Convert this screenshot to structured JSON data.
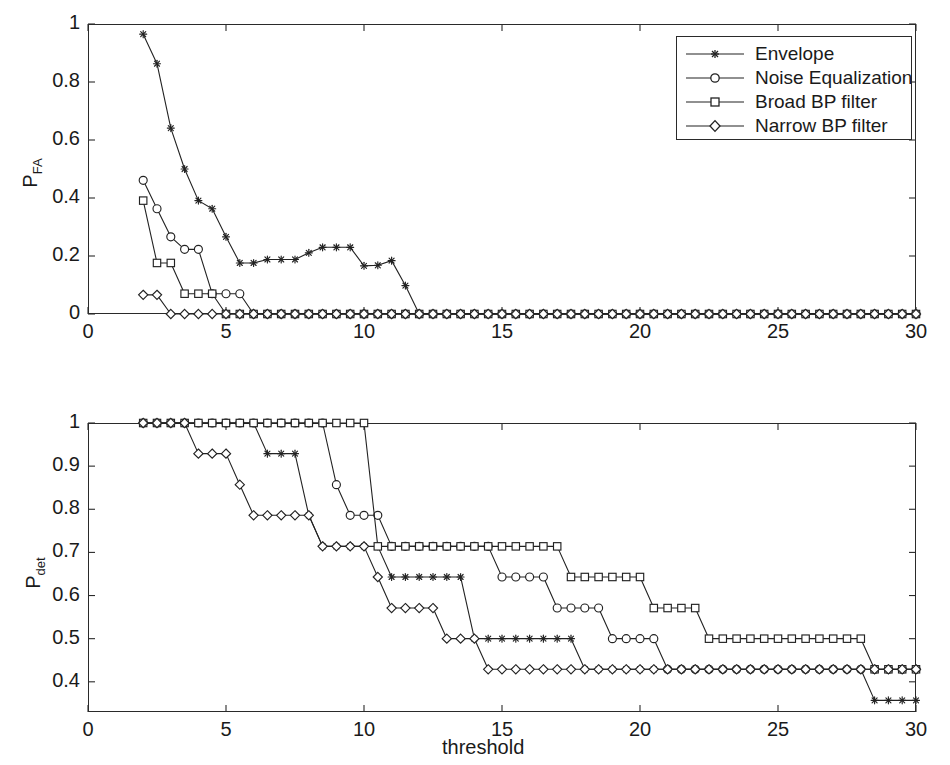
{
  "figure": {
    "background": "#ffffff",
    "line_color": "#222222",
    "axis_color": "#2a2a2a"
  },
  "legend": {
    "position": "top-right-of-upper-panel",
    "entries": [
      {
        "label": "Envelope",
        "marker": "star"
      },
      {
        "label": "Noise Equalization",
        "marker": "circle"
      },
      {
        "label": "Broad BP filter",
        "marker": "square"
      },
      {
        "label": "Narrow BP filter",
        "marker": "diamond"
      }
    ]
  },
  "chart_data": [
    {
      "type": "line",
      "panel": "upper",
      "title": "",
      "xlabel": "",
      "ylabel": "P_FA",
      "ylabel_base": "P",
      "ylabel_sub": "FA",
      "xlim": [
        0,
        30
      ],
      "ylim": [
        0,
        1
      ],
      "xticks": [
        0,
        5,
        10,
        15,
        20,
        25,
        30
      ],
      "xticklabels": [
        "0",
        "5",
        "10",
        "15",
        "20",
        "25",
        "30"
      ],
      "yticks": [
        0,
        0.2,
        0.4,
        0.6,
        0.8,
        1
      ],
      "yticklabels": [
        "0",
        "0.2",
        "0.4",
        "0.6",
        "0.8",
        "1"
      ],
      "grid": false,
      "legend_position": "upper right",
      "x": [
        2,
        2.5,
        3,
        3.5,
        4,
        4.5,
        5,
        5.5,
        6,
        6.5,
        7,
        7.5,
        8,
        8.5,
        9,
        9.5,
        10,
        10.5,
        11,
        11.5,
        12,
        12.5,
        13,
        13.5,
        14,
        14.5,
        15,
        15.5,
        16,
        16.5,
        17,
        17.5,
        18,
        18.5,
        19,
        19.5,
        20,
        20.5,
        21,
        21.5,
        22,
        22.5,
        23,
        23.5,
        24,
        24.5,
        25,
        25.5,
        26,
        26.5,
        27,
        27.5,
        28,
        28.5,
        29,
        29.5,
        30
      ],
      "series": [
        {
          "name": "Envelope",
          "marker": "star",
          "values": [
            0.965,
            0.863,
            0.641,
            0.5,
            0.391,
            0.363,
            0.266,
            0.176,
            0.176,
            0.188,
            0.188,
            0.188,
            0.211,
            0.23,
            0.23,
            0.23,
            0.166,
            0.168,
            0.184,
            0.098,
            0,
            0,
            0,
            0,
            0,
            0,
            0,
            0,
            0,
            0,
            0,
            0,
            0,
            0,
            0,
            0,
            0,
            0,
            0,
            0,
            0,
            0,
            0,
            0,
            0,
            0,
            0,
            0,
            0,
            0,
            0,
            0,
            0,
            0,
            0,
            0,
            0
          ]
        },
        {
          "name": "Noise Equalization",
          "marker": "circle",
          "values": [
            0.461,
            0.363,
            0.266,
            0.223,
            0.223,
            0.07,
            0.07,
            0.07,
            0,
            0,
            0,
            0,
            0,
            0,
            0,
            0,
            0,
            0,
            0,
            0,
            0,
            0,
            0,
            0,
            0,
            0,
            0,
            0,
            0,
            0,
            0,
            0,
            0,
            0,
            0,
            0,
            0,
            0,
            0,
            0,
            0,
            0,
            0,
            0,
            0,
            0,
            0,
            0,
            0,
            0,
            0,
            0,
            0,
            0,
            0,
            0,
            0
          ]
        },
        {
          "name": "Broad BP filter",
          "marker": "square",
          "values": [
            0.391,
            0.176,
            0.176,
            0.07,
            0.07,
            0.07,
            0,
            0,
            0,
            0,
            0,
            0,
            0,
            0,
            0,
            0,
            0,
            0,
            0,
            0,
            0,
            0,
            0,
            0,
            0,
            0,
            0,
            0,
            0,
            0,
            0,
            0,
            0,
            0,
            0,
            0,
            0,
            0,
            0,
            0,
            0,
            0,
            0,
            0,
            0,
            0,
            0,
            0,
            0,
            0,
            0,
            0,
            0,
            0,
            0,
            0,
            0
          ]
        },
        {
          "name": "Narrow BP filter",
          "marker": "diamond",
          "values": [
            0.066,
            0.066,
            0,
            0,
            0,
            0,
            0,
            0,
            0,
            0,
            0,
            0,
            0,
            0,
            0,
            0,
            0,
            0,
            0,
            0,
            0,
            0,
            0,
            0,
            0,
            0,
            0,
            0,
            0,
            0,
            0,
            0,
            0,
            0,
            0,
            0,
            0,
            0,
            0,
            0,
            0,
            0,
            0,
            0,
            0,
            0,
            0,
            0,
            0,
            0,
            0,
            0,
            0,
            0,
            0,
            0,
            0
          ]
        }
      ]
    },
    {
      "type": "line",
      "panel": "lower",
      "title": "",
      "xlabel": "threshold",
      "ylabel": "P_det",
      "ylabel_base": "P",
      "ylabel_sub": "det",
      "xlim": [
        0,
        30
      ],
      "ylim": [
        0.33,
        1.0
      ],
      "xticks": [
        0,
        5,
        10,
        15,
        20,
        25,
        30
      ],
      "xticklabels": [
        "0",
        "5",
        "10",
        "15",
        "20",
        "25",
        "30"
      ],
      "yticks": [
        0.4,
        0.5,
        0.6,
        0.7,
        0.8,
        0.9,
        1
      ],
      "yticklabels": [
        "0.4",
        "0.5",
        "0.6",
        "0.7",
        "0.8",
        "0.9",
        "1"
      ],
      "grid": false,
      "x": [
        2,
        2.5,
        3,
        3.5,
        4,
        4.5,
        5,
        5.5,
        6,
        6.5,
        7,
        7.5,
        8,
        8.5,
        9,
        9.5,
        10,
        10.5,
        11,
        11.5,
        12,
        12.5,
        13,
        13.5,
        14,
        14.5,
        15,
        15.5,
        16,
        16.5,
        17,
        17.5,
        18,
        18.5,
        19,
        19.5,
        20,
        20.5,
        21,
        21.5,
        22,
        22.5,
        23,
        23.5,
        24,
        24.5,
        25,
        25.5,
        26,
        26.5,
        27,
        27.5,
        28,
        28.5,
        29,
        29.5,
        30
      ],
      "series": [
        {
          "name": "Envelope",
          "marker": "star",
          "values": [
            1,
            1,
            1,
            1,
            1,
            1,
            1,
            1,
            1,
            0.929,
            0.929,
            0.929,
            0.786,
            0.714,
            0.714,
            0.714,
            0.714,
            0.714,
            0.643,
            0.643,
            0.643,
            0.643,
            0.643,
            0.643,
            0.5,
            0.5,
            0.5,
            0.5,
            0.5,
            0.5,
            0.5,
            0.5,
            0.429,
            0.429,
            0.429,
            0.429,
            0.429,
            0.429,
            0.429,
            0.429,
            0.429,
            0.429,
            0.429,
            0.429,
            0.429,
            0.429,
            0.429,
            0.429,
            0.429,
            0.429,
            0.429,
            0.429,
            0.429,
            0.357,
            0.357,
            0.357,
            0.357
          ]
        },
        {
          "name": "Noise Equalization",
          "marker": "circle",
          "values": [
            1,
            1,
            1,
            1,
            1,
            1,
            1,
            1,
            1,
            1,
            1,
            1,
            1,
            1,
            0.857,
            0.786,
            0.786,
            0.786,
            0.714,
            0.714,
            0.714,
            0.714,
            0.714,
            0.714,
            0.714,
            0.714,
            0.643,
            0.643,
            0.643,
            0.643,
            0.571,
            0.571,
            0.571,
            0.571,
            0.5,
            0.5,
            0.5,
            0.5,
            0.429,
            0.429,
            0.429,
            0.429,
            0.429,
            0.429,
            0.429,
            0.429,
            0.429,
            0.429,
            0.429,
            0.429,
            0.429,
            0.429,
            0.429,
            0.429,
            0.429,
            0.429,
            0.429
          ]
        },
        {
          "name": "Broad BP filter",
          "marker": "square",
          "values": [
            1,
            1,
            1,
            1,
            1,
            1,
            1,
            1,
            1,
            1,
            1,
            1,
            1,
            1,
            1,
            1,
            1,
            0.714,
            0.714,
            0.714,
            0.714,
            0.714,
            0.714,
            0.714,
            0.714,
            0.714,
            0.714,
            0.714,
            0.714,
            0.714,
            0.714,
            0.643,
            0.643,
            0.643,
            0.643,
            0.643,
            0.643,
            0.571,
            0.571,
            0.571,
            0.571,
            0.5,
            0.5,
            0.5,
            0.5,
            0.5,
            0.5,
            0.5,
            0.5,
            0.5,
            0.5,
            0.5,
            0.5,
            0.429,
            0.429,
            0.429,
            0.429
          ]
        },
        {
          "name": "Narrow BP filter",
          "marker": "diamond",
          "values": [
            1,
            1,
            1,
            1,
            0.929,
            0.929,
            0.929,
            0.857,
            0.786,
            0.786,
            0.786,
            0.786,
            0.786,
            0.714,
            0.714,
            0.714,
            0.714,
            0.643,
            0.571,
            0.571,
            0.571,
            0.571,
            0.5,
            0.5,
            0.5,
            0.429,
            0.429,
            0.429,
            0.429,
            0.429,
            0.429,
            0.429,
            0.429,
            0.429,
            0.429,
            0.429,
            0.429,
            0.429,
            0.429,
            0.429,
            0.429,
            0.429,
            0.429,
            0.429,
            0.429,
            0.429,
            0.429,
            0.429,
            0.429,
            0.429,
            0.429,
            0.429,
            0.429,
            0.429,
            0.429,
            0.429,
            0.429
          ]
        }
      ]
    }
  ]
}
